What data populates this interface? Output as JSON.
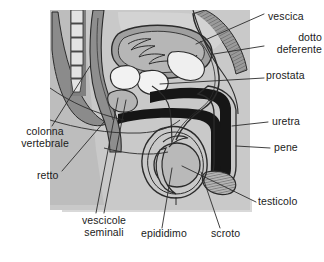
{
  "figure": {
    "language": "it",
    "palette": {
      "background": "#ffffff",
      "body_light": "#c9c9c9",
      "body_mid": "#a8a8a8",
      "body_dark": "#787878",
      "organ_white": "#f2f2f2",
      "organ_black": "#161616",
      "outline": "#2b2b2b",
      "shadow": "#d9d9d9",
      "label_text": "#1b1b1b"
    }
  },
  "labels": [
    {
      "id": "vescica",
      "text": "vescica",
      "x": 268,
      "y": 11,
      "align": "left"
    },
    {
      "id": "dotto-deferente",
      "text": "dotto\ndeferente",
      "x": 268,
      "y": 38,
      "align": "left"
    },
    {
      "id": "prostata",
      "text": "prostata",
      "x": 268,
      "y": 75,
      "align": "left"
    },
    {
      "id": "uretra",
      "text": "uretra",
      "x": 272,
      "y": 120,
      "align": "left"
    },
    {
      "id": "pene",
      "text": "pene",
      "x": 274,
      "y": 146,
      "align": "left"
    },
    {
      "id": "testicolo",
      "text": "testicolo",
      "x": 258,
      "y": 200,
      "align": "left"
    },
    {
      "id": "colonna-vertebrale",
      "text": "colonna\nvertebrale",
      "x": 20,
      "y": 131,
      "align": "left"
    },
    {
      "id": "retto",
      "text": "retto",
      "x": 37,
      "y": 175,
      "align": "left"
    },
    {
      "id": "vescicole-seminali",
      "text": "vescicole\nseminali",
      "x": 76,
      "y": 219,
      "align": "left"
    },
    {
      "id": "epididimo",
      "text": "epididimo",
      "x": 141,
      "y": 232,
      "align": "left"
    },
    {
      "id": "scroto",
      "text": "scroto",
      "x": 211,
      "y": 232,
      "align": "left"
    }
  ],
  "structures": [
    {
      "id": "spinal-column",
      "label_ref": "colonna-vertebrale"
    },
    {
      "id": "rectum",
      "label_ref": "retto"
    },
    {
      "id": "bladder",
      "label_ref": "vescica"
    },
    {
      "id": "vas-deferens",
      "label_ref": "dotto-deferente"
    },
    {
      "id": "prostate",
      "label_ref": "prostata"
    },
    {
      "id": "seminal-vesicles",
      "label_ref": "vescicole-seminali"
    },
    {
      "id": "urethra",
      "label_ref": "uretra"
    },
    {
      "id": "penis",
      "label_ref": "pene"
    },
    {
      "id": "testicle",
      "label_ref": "testicolo"
    },
    {
      "id": "epididymis",
      "label_ref": "epididimo"
    },
    {
      "id": "scrotum",
      "label_ref": "scroto"
    }
  ]
}
